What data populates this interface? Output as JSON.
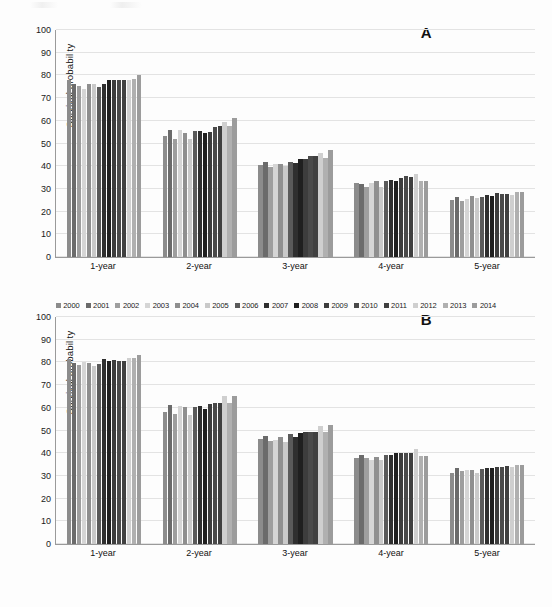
{
  "figure": {
    "background": "#fdfdfd",
    "panels": [
      {
        "letter": "A",
        "ylabel": "Survival probability",
        "legend_position": "bottom"
      },
      {
        "letter": "B",
        "ylabel": "Survival probability",
        "legend_position": "bottom"
      }
    ]
  },
  "series_colors": [
    "#8c8c8c",
    "#6b6b6b",
    "#9e9e9e",
    "#d5d5d5",
    "#8f8f8f",
    "#c9c9c9",
    "#5a5a5a",
    "#2f2f2f",
    "#1f1f1f",
    "#3d3d3d",
    "#4a4a4a",
    "#404040",
    "#cfcfcf",
    "#b0b0b0",
    "#9c9c9c"
  ],
  "chart_data": [
    {
      "type": "bar",
      "panel": "A",
      "title": "A",
      "xlabel": "",
      "ylabel": "Survival probability",
      "ylim": [
        0,
        100
      ],
      "yticks": [
        0,
        10,
        20,
        30,
        40,
        50,
        60,
        70,
        80,
        90,
        100
      ],
      "grid": true,
      "legend": "bottom",
      "categories": [
        "1-year",
        "2-year",
        "3-year",
        "4-year",
        "5-year"
      ],
      "series": [
        {
          "name": "2000",
          "values": [
            78.0,
            53.3,
            40.5,
            32.5,
            25.0
          ]
        },
        {
          "name": "2001",
          "values": [
            76.0,
            56.0,
            42.0,
            32.0,
            26.5
          ]
        },
        {
          "name": "2002",
          "values": [
            75.5,
            51.8,
            39.5,
            31.0,
            24.8
          ]
        },
        {
          "name": "2003",
          "values": [
            74.0,
            55.8,
            41.0,
            32.5,
            25.5
          ]
        },
        {
          "name": "2004",
          "values": [
            76.3,
            54.5,
            41.0,
            33.5,
            27.0
          ]
        },
        {
          "name": "2005",
          "values": [
            76.0,
            52.0,
            40.2,
            31.0,
            25.8
          ]
        },
        {
          "name": "2006",
          "values": [
            74.8,
            55.5,
            42.0,
            33.5,
            26.5
          ]
        },
        {
          "name": "2007",
          "values": [
            76.2,
            55.5,
            41.5,
            33.8,
            27.5
          ]
        },
        {
          "name": "2008",
          "values": [
            77.8,
            54.8,
            43.0,
            33.5,
            27.0
          ]
        },
        {
          "name": "2009",
          "values": [
            77.8,
            55.2,
            43.0,
            35.0,
            28.0
          ]
        },
        {
          "name": "2010",
          "values": [
            78.0,
            57.3,
            44.5,
            35.5,
            27.8
          ]
        },
        {
          "name": "2011",
          "values": [
            78.0,
            57.5,
            44.5,
            35.3,
            27.8
          ]
        },
        {
          "name": "2012",
          "values": [
            78.0,
            59.5,
            46.0,
            36.5,
            27.5
          ]
        },
        {
          "name": "2013",
          "values": [
            78.5,
            57.8,
            43.5,
            33.3,
            28.5
          ]
        },
        {
          "name": "2014",
          "values": [
            80.3,
            61.2,
            47.2,
            33.3,
            28.5
          ]
        }
      ]
    },
    {
      "type": "bar",
      "panel": "B",
      "title": "B",
      "xlabel": "",
      "ylabel": "Survival probability",
      "ylim": [
        0,
        100
      ],
      "yticks": [
        0,
        10,
        20,
        30,
        40,
        50,
        60,
        70,
        80,
        90,
        100
      ],
      "grid": true,
      "legend": "bottom",
      "categories": [
        "1-year",
        "2-year",
        "3-year",
        "4-year",
        "5-year"
      ],
      "series": [
        {
          "name": "2000",
          "values": [
            81.5,
            58.3,
            46.3,
            38.0,
            31.5
          ]
        },
        {
          "name": "2001",
          "values": [
            79.8,
            61.3,
            47.8,
            39.2,
            33.3
          ]
        },
        {
          "name": "2002",
          "values": [
            78.8,
            57.3,
            45.5,
            38.0,
            32.0
          ]
        },
        {
          "name": "2003",
          "values": [
            80.3,
            60.8,
            46.0,
            36.8,
            32.5
          ]
        },
        {
          "name": "2004",
          "values": [
            79.8,
            60.3,
            47.2,
            38.5,
            32.5
          ]
        },
        {
          "name": "2005",
          "values": [
            78.3,
            57.0,
            45.0,
            36.8,
            31.3
          ]
        },
        {
          "name": "2006",
          "values": [
            79.3,
            60.3,
            48.3,
            39.0,
            33.0
          ]
        },
        {
          "name": "2007",
          "values": [
            81.5,
            61.0,
            47.3,
            39.3,
            33.5
          ]
        },
        {
          "name": "2008",
          "values": [
            80.8,
            59.3,
            49.0,
            40.2,
            33.3
          ]
        },
        {
          "name": "2009",
          "values": [
            81.0,
            61.5,
            49.5,
            40.3,
            33.8
          ]
        },
        {
          "name": "2010",
          "values": [
            80.8,
            62.0,
            49.5,
            40.3,
            34.0
          ]
        },
        {
          "name": "2011",
          "values": [
            80.8,
            62.3,
            49.3,
            40.3,
            34.3
          ]
        },
        {
          "name": "2012",
          "values": [
            82.0,
            65.0,
            52.0,
            41.8,
            34.0
          ]
        },
        {
          "name": "2013",
          "values": [
            81.8,
            62.3,
            49.5,
            38.8,
            34.8
          ]
        },
        {
          "name": "2014",
          "values": [
            83.3,
            65.3,
            52.3,
            38.8,
            34.8
          ]
        }
      ]
    }
  ]
}
